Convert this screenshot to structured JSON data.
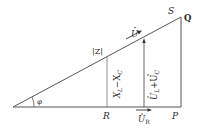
{
  "diagram": {
    "type": "impedance-voltage-triangle",
    "labels": {
      "S": "S",
      "Q": "Q",
      "Z": "|Z|",
      "U": "U",
      "XL_XC": "X",
      "XL_sub": "L",
      "XL_minus": "−X",
      "XC_sub": "C",
      "UL_UC_main": "U",
      "UL_sub": "L",
      "UL_plus": "+U",
      "UC_sub": "C",
      "R": "R",
      "UR": "U",
      "UR_sub": "R",
      "P": "P",
      "phi": "φ"
    },
    "colors": {
      "line": "#555555",
      "text": "#2a2a2a",
      "background": "#ffffff"
    }
  }
}
